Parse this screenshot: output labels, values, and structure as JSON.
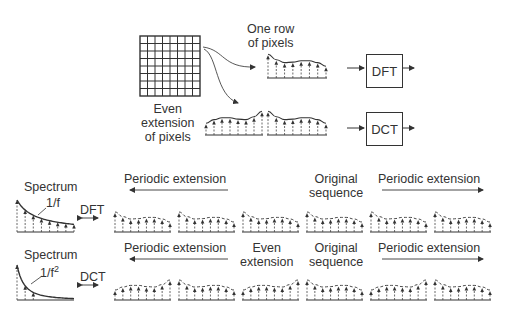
{
  "top": {
    "row_label": "One row\nof pixels",
    "row_label_line1": "One row",
    "row_label_line2": "of pixels",
    "even_label_line1": "Even",
    "even_label_line2": "extension",
    "even_label_line3": "of pixels",
    "dft_box": "DFT",
    "dct_box": "DCT",
    "grid_size": 8
  },
  "dft_row": {
    "spectrum_label": "Spectrum",
    "spectrum_formula": "1/f",
    "transform_label": "DFT",
    "left_label": "Periodic extension",
    "center_label_line1": "Original",
    "center_label_line2": "sequence",
    "right_label": "Periodic extension"
  },
  "dct_row": {
    "spectrum_label": "Spectrum",
    "spectrum_formula_base": "1/f",
    "spectrum_formula_exp": "2",
    "transform_label": "DCT",
    "left_label": "Periodic extension",
    "even_label_line1": "Even",
    "even_label_line2": "extension",
    "center_label_line1": "Original",
    "center_label_line2": "sequence",
    "right_label": "Periodic extension"
  },
  "signal": {
    "samples": [
      0.95,
      0.72,
      0.6,
      0.62,
      0.68,
      0.68,
      0.6,
      0.45
    ]
  }
}
